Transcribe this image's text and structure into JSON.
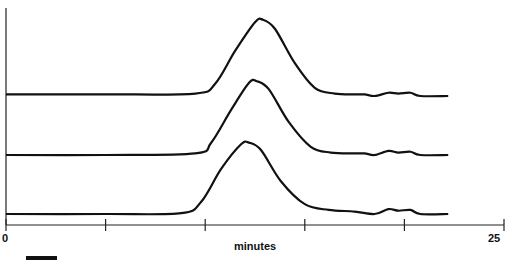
{
  "chart_data": {
    "type": "line",
    "title": "",
    "xlabel": "minutes",
    "ylabel": "",
    "xlim": [
      0,
      25
    ],
    "x_ticks": [
      0,
      5,
      10,
      15,
      20,
      25
    ],
    "x_tick_labels_shown": [
      "0",
      "25"
    ],
    "grid": false,
    "legend": null,
    "layout": "three vertically offset (stacked) chromatogram traces",
    "series": [
      {
        "name": "trace-top",
        "baseline_offset": 2,
        "points": [
          [
            0,
            0.02
          ],
          [
            5,
            0.02
          ],
          [
            9.5,
            0.03
          ],
          [
            10.5,
            0.15
          ],
          [
            11.5,
            0.55
          ],
          [
            12.5,
            0.9
          ],
          [
            12.9,
            0.93
          ],
          [
            13.5,
            0.82
          ],
          [
            14.5,
            0.4
          ],
          [
            15.5,
            0.1
          ],
          [
            16.5,
            0.03
          ],
          [
            17.5,
            0.02
          ],
          [
            18,
            0.02
          ],
          [
            18.5,
            0.0
          ],
          [
            19.2,
            0.04
          ],
          [
            19.7,
            0.03
          ],
          [
            20.3,
            0.04
          ],
          [
            20.8,
            0.0
          ],
          [
            22.2,
            0.0
          ]
        ]
      },
      {
        "name": "trace-middle",
        "baseline_offset": 1,
        "points": [
          [
            0,
            0.0
          ],
          [
            5,
            0.0
          ],
          [
            9.5,
            0.02
          ],
          [
            10.3,
            0.15
          ],
          [
            11.3,
            0.55
          ],
          [
            12.2,
            0.88
          ],
          [
            12.6,
            0.9
          ],
          [
            13.2,
            0.8
          ],
          [
            14.2,
            0.4
          ],
          [
            15.3,
            0.1
          ],
          [
            16.3,
            0.03
          ],
          [
            17.5,
            0.02
          ],
          [
            18,
            0.02
          ],
          [
            18.5,
            0.0
          ],
          [
            19.2,
            0.05
          ],
          [
            19.7,
            0.03
          ],
          [
            20.3,
            0.04
          ],
          [
            20.8,
            0.0
          ],
          [
            22.2,
            0.0
          ]
        ]
      },
      {
        "name": "trace-bottom",
        "baseline_offset": 0,
        "points": [
          [
            0,
            0.0
          ],
          [
            5,
            0.0
          ],
          [
            8.8,
            0.01
          ],
          [
            9.8,
            0.15
          ],
          [
            10.8,
            0.55
          ],
          [
            11.8,
            0.85
          ],
          [
            12.2,
            0.87
          ],
          [
            12.8,
            0.78
          ],
          [
            13.8,
            0.4
          ],
          [
            15,
            0.12
          ],
          [
            16.2,
            0.05
          ],
          [
            17.5,
            0.03
          ],
          [
            18.5,
            0.0
          ],
          [
            19.2,
            0.06
          ],
          [
            19.7,
            0.04
          ],
          [
            20.3,
            0.05
          ],
          [
            20.8,
            0.0
          ],
          [
            22.2,
            0.0
          ]
        ]
      }
    ]
  },
  "axis": {
    "x_start_label": "0",
    "x_end_label": "25",
    "x_title": "minutes"
  }
}
